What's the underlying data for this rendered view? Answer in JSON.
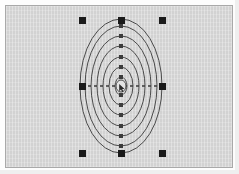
{
  "app": {
    "title": "Concentric Ellipses Selection",
    "canvas_width": 239,
    "canvas_height": 174
  },
  "colors": {
    "page_background": "#fdfdfd",
    "canvas_background": "#d6d6d6",
    "canvas_border": "#a9a9a9",
    "stroke": "#4b4b4b",
    "handle": "#1a1a1a",
    "axis": "#3a3a3a"
  },
  "canvas": {
    "frame": {
      "x": 5,
      "y": 5,
      "width": 228,
      "height": 163
    },
    "label": "drawing-canvas"
  },
  "shape": {
    "name": "concentric-ellipses",
    "center": {
      "x": 121,
      "y": 86
    },
    "rings": [
      {
        "rx": 6,
        "ry": 9
      },
      {
        "rx": 12,
        "ry": 19
      },
      {
        "rx": 18,
        "ry": 29
      },
      {
        "rx": 24,
        "ry": 40
      },
      {
        "rx": 30,
        "ry": 50
      },
      {
        "rx": 36,
        "ry": 60
      },
      {
        "rx": 41,
        "ry": 67
      }
    ],
    "node_dots_vertical": [
      {
        "x": 121,
        "y": 77
      },
      {
        "x": 121,
        "y": 67
      },
      {
        "x": 121,
        "y": 57
      },
      {
        "x": 121,
        "y": 46
      },
      {
        "x": 121,
        "y": 36
      },
      {
        "x": 121,
        "y": 26
      },
      {
        "x": 121,
        "y": 95
      },
      {
        "x": 121,
        "y": 105
      },
      {
        "x": 121,
        "y": 115
      },
      {
        "x": 121,
        "y": 126
      },
      {
        "x": 121,
        "y": 136
      },
      {
        "x": 121,
        "y": 146
      }
    ],
    "axis_line": {
      "x1": 82,
      "y1": 86,
      "x2": 162,
      "y2": 86,
      "style": "dashed"
    }
  },
  "selection": {
    "label": "selection-handles",
    "handle_size": 6,
    "bbox": {
      "left": 82,
      "top": 20,
      "right": 162,
      "bottom": 153
    },
    "handles": [
      {
        "name": "handle-top-left",
        "x": 82,
        "y": 20
      },
      {
        "name": "handle-top-center",
        "x": 121,
        "y": 20
      },
      {
        "name": "handle-top-right",
        "x": 162,
        "y": 20
      },
      {
        "name": "handle-middle-left",
        "x": 82,
        "y": 86
      },
      {
        "name": "handle-middle-right",
        "x": 162,
        "y": 86
      },
      {
        "name": "handle-bottom-left",
        "x": 82,
        "y": 153
      },
      {
        "name": "handle-bottom-center",
        "x": 121,
        "y": 153
      },
      {
        "name": "handle-bottom-right",
        "x": 162,
        "y": 153
      }
    ]
  },
  "cursor": {
    "name": "mouse-pointer",
    "x": 121,
    "y": 87
  }
}
